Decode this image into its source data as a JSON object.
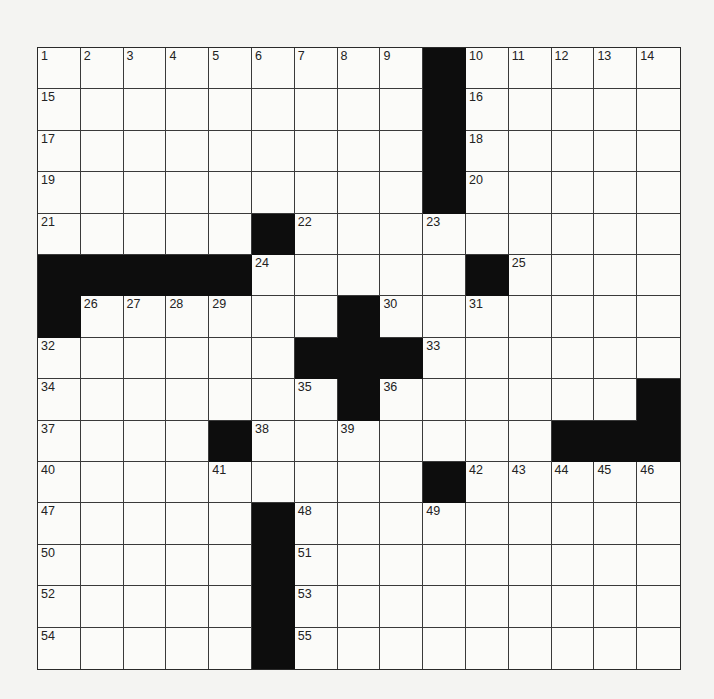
{
  "puzzle": {
    "rows": 15,
    "cols": 15,
    "colors": {
      "black": "#0d0d0d",
      "white": "#fbfbf9",
      "line": "#3a3a3a",
      "page": "#f4f4f2"
    },
    "layout": [
      ".........#.....",
      ".........#.....",
      ".........#.....",
      ".........#.....",
      ".....#.........",
      "#####.....#....",
      "#......#.......",
      "......###......",
      ".......#......#",
      "....#.......####",
      ".........#.....",
      ".....#.........",
      ".....#.........",
      ".....#.........",
      ".....#........."
    ],
    "numbers": [
      {
        "r": 0,
        "c": 0,
        "n": "1"
      },
      {
        "r": 0,
        "c": 1,
        "n": "2"
      },
      {
        "r": 0,
        "c": 2,
        "n": "3"
      },
      {
        "r": 0,
        "c": 3,
        "n": "4"
      },
      {
        "r": 0,
        "c": 4,
        "n": "5"
      },
      {
        "r": 0,
        "c": 5,
        "n": "6"
      },
      {
        "r": 0,
        "c": 6,
        "n": "7"
      },
      {
        "r": 0,
        "c": 7,
        "n": "8"
      },
      {
        "r": 0,
        "c": 8,
        "n": "9"
      },
      {
        "r": 0,
        "c": 10,
        "n": "10"
      },
      {
        "r": 0,
        "c": 11,
        "n": "11"
      },
      {
        "r": 0,
        "c": 12,
        "n": "12"
      },
      {
        "r": 0,
        "c": 13,
        "n": "13"
      },
      {
        "r": 0,
        "c": 14,
        "n": "14"
      },
      {
        "r": 1,
        "c": 0,
        "n": "15"
      },
      {
        "r": 1,
        "c": 10,
        "n": "16"
      },
      {
        "r": 2,
        "c": 0,
        "n": "17"
      },
      {
        "r": 2,
        "c": 10,
        "n": "18"
      },
      {
        "r": 3,
        "c": 0,
        "n": "19"
      },
      {
        "r": 3,
        "c": 10,
        "n": "20"
      },
      {
        "r": 4,
        "c": 0,
        "n": "21"
      },
      {
        "r": 4,
        "c": 6,
        "n": "22"
      },
      {
        "r": 4,
        "c": 9,
        "n": "23"
      },
      {
        "r": 5,
        "c": 5,
        "n": "24"
      },
      {
        "r": 5,
        "c": 11,
        "n": "25"
      },
      {
        "r": 6,
        "c": 1,
        "n": "26"
      },
      {
        "r": 6,
        "c": 2,
        "n": "27"
      },
      {
        "r": 6,
        "c": 3,
        "n": "28"
      },
      {
        "r": 6,
        "c": 4,
        "n": "29"
      },
      {
        "r": 6,
        "c": 8,
        "n": "30"
      },
      {
        "r": 6,
        "c": 10,
        "n": "31"
      },
      {
        "r": 7,
        "c": 0,
        "n": "32"
      },
      {
        "r": 7,
        "c": 9,
        "n": "33"
      },
      {
        "r": 8,
        "c": 0,
        "n": "34"
      },
      {
        "r": 8,
        "c": 6,
        "n": "35"
      },
      {
        "r": 8,
        "c": 8,
        "n": "36"
      },
      {
        "r": 9,
        "c": 0,
        "n": "37"
      },
      {
        "r": 9,
        "c": 5,
        "n": "38"
      },
      {
        "r": 9,
        "c": 7,
        "n": "39"
      },
      {
        "r": 10,
        "c": 0,
        "n": "40"
      },
      {
        "r": 10,
        "c": 4,
        "n": "41"
      },
      {
        "r": 10,
        "c": 10,
        "n": "42"
      },
      {
        "r": 10,
        "c": 11,
        "n": "43"
      },
      {
        "r": 10,
        "c": 12,
        "n": "44"
      },
      {
        "r": 10,
        "c": 13,
        "n": "45"
      },
      {
        "r": 10,
        "c": 14,
        "n": "46"
      },
      {
        "r": 11,
        "c": 0,
        "n": "47"
      },
      {
        "r": 11,
        "c": 6,
        "n": "48"
      },
      {
        "r": 11,
        "c": 9,
        "n": "49"
      },
      {
        "r": 12,
        "c": 0,
        "n": "50"
      },
      {
        "r": 12,
        "c": 6,
        "n": "51"
      },
      {
        "r": 13,
        "c": 0,
        "n": "52"
      },
      {
        "r": 13,
        "c": 6,
        "n": "53"
      },
      {
        "r": 14,
        "c": 0,
        "n": "54"
      },
      {
        "r": 14,
        "c": 6,
        "n": "55"
      }
    ]
  }
}
